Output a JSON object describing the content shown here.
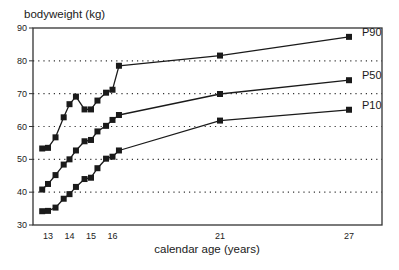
{
  "chart_data": {
    "type": "line",
    "title": "",
    "xlabel": "calendar age (years)",
    "ylabel": "bodyweight (kg)",
    "xlim": [
      12.5,
      28.6
    ],
    "ylim": [
      30,
      90
    ],
    "x_ticks": [
      13,
      14,
      15,
      16,
      21,
      27
    ],
    "y_ticks": [
      30,
      40,
      50,
      60,
      70,
      80,
      90
    ],
    "grid": {
      "horizontal": true,
      "style": "dotted",
      "lines": [
        40,
        50,
        60,
        70,
        80
      ]
    },
    "legend": "inline labels at right end of each series",
    "x": [
      12.73,
      13.0,
      13.35,
      13.73,
      14.0,
      14.3,
      14.7,
      15.0,
      15.3,
      15.7,
      16.0,
      16.3,
      21,
      27
    ],
    "series": [
      {
        "name": "P90",
        "values": [
          53.3,
          53.5,
          56.7,
          62.8,
          66.8,
          69.1,
          65.2,
          65.2,
          67.9,
          70.3,
          71.2,
          78.5,
          81.6,
          87.3
        ]
      },
      {
        "name": "P50",
        "values": [
          40.8,
          42.5,
          45.2,
          48.4,
          50.0,
          52.7,
          55.5,
          55.9,
          58.5,
          60.2,
          62.0,
          63.5,
          69.9,
          74.1
        ]
      },
      {
        "name": "P10",
        "values": [
          34.2,
          34.3,
          35.3,
          38.0,
          39.4,
          41.6,
          44.0,
          44.4,
          47.3,
          50.2,
          50.8,
          52.7,
          61.8,
          65.1
        ]
      }
    ],
    "marker": "filled-square",
    "line_color": "#1a1a1a",
    "grid_color": "#333333"
  }
}
